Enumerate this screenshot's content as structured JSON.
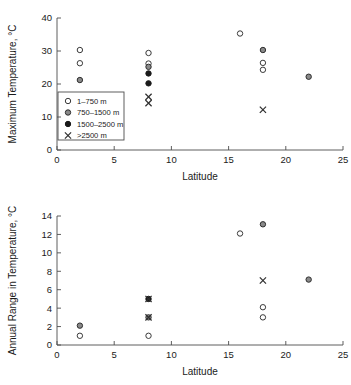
{
  "figure": {
    "legend_entries": [
      {
        "label": "1–750 m",
        "marker": "open-circle"
      },
      {
        "label": "750–1500 m",
        "marker": "half-filled-circle"
      },
      {
        "label": "1500–2500 m",
        "marker": "filled-circle"
      },
      {
        "label": ">2500 m",
        "marker": "cross"
      }
    ]
  },
  "chart_data": [
    {
      "id": "maximum-temperature",
      "type": "scatter",
      "title": "",
      "xlabel": "Latitude",
      "ylabel": "Maximum Temperature, °C",
      "xlim": [
        0,
        25
      ],
      "ylim": [
        0,
        40
      ],
      "xticks": [
        0,
        5,
        10,
        15,
        20,
        25
      ],
      "yticks": [
        0,
        10,
        20,
        30,
        40
      ],
      "grid": false,
      "legend_position": "lower-left-inside",
      "series": [
        {
          "name": "1–750 m",
          "marker": "open-circle",
          "points": [
            {
              "x": 2,
              "y": 30.3
            },
            {
              "x": 2,
              "y": 26.3
            },
            {
              "x": 8,
              "y": 29.4
            },
            {
              "x": 8,
              "y": 26.2
            },
            {
              "x": 16,
              "y": 35.3
            },
            {
              "x": 18,
              "y": 26.4
            },
            {
              "x": 18,
              "y": 24.3
            }
          ]
        },
        {
          "name": "750–1500 m",
          "marker": "half-filled-circle",
          "points": [
            {
              "x": 2,
              "y": 21.2
            },
            {
              "x": 8,
              "y": 25.2
            },
            {
              "x": 18,
              "y": 30.3
            },
            {
              "x": 22,
              "y": 22.2
            }
          ]
        },
        {
          "name": "1500–2500 m",
          "marker": "filled-circle",
          "points": [
            {
              "x": 8,
              "y": 23.2
            },
            {
              "x": 8,
              "y": 20.2
            }
          ]
        },
        {
          "name": ">2500 m",
          "marker": "cross",
          "points": [
            {
              "x": 8,
              "y": 16.1
            },
            {
              "x": 8,
              "y": 14.2
            },
            {
              "x": 18,
              "y": 12.2
            }
          ]
        }
      ]
    },
    {
      "id": "annual-range-in-temperature",
      "type": "scatter",
      "title": "",
      "xlabel": "Latitude",
      "ylabel": "Annual Range in Temperature, °C",
      "xlim": [
        0,
        25
      ],
      "ylim": [
        0,
        14
      ],
      "xticks": [
        0,
        5,
        10,
        15,
        20,
        25
      ],
      "yticks": [
        0,
        2,
        4,
        6,
        8,
        10,
        12,
        14
      ],
      "grid": false,
      "legend_position": "none",
      "series": [
        {
          "name": "1–750 m",
          "marker": "open-circle",
          "points": [
            {
              "x": 2,
              "y": 1.0
            },
            {
              "x": 8,
              "y": 1.0
            },
            {
              "x": 16,
              "y": 12.1
            },
            {
              "x": 18,
              "y": 4.1
            },
            {
              "x": 18,
              "y": 3.0
            }
          ]
        },
        {
          "name": "750–1500 m",
          "marker": "half-filled-circle",
          "points": [
            {
              "x": 2,
              "y": 2.1
            },
            {
              "x": 8,
              "y": 3.0
            },
            {
              "x": 18,
              "y": 13.1
            },
            {
              "x": 22,
              "y": 7.1
            }
          ]
        },
        {
          "name": "1500–2500 m",
          "marker": "filled-circle",
          "points": [
            {
              "x": 8,
              "y": 5.0
            }
          ]
        },
        {
          "name": ">2500 m",
          "marker": "cross",
          "points": [
            {
              "x": 8,
              "y": 5.0
            },
            {
              "x": 8,
              "y": 3.0
            },
            {
              "x": 18,
              "y": 7.0
            }
          ]
        }
      ]
    }
  ]
}
